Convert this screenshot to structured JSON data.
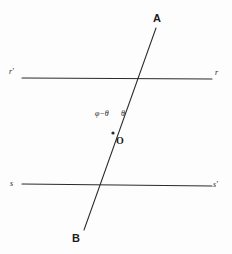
{
  "figure": {
    "background_color": "#fdfdfd",
    "stroke_color": "#2b2b2b",
    "width": 232,
    "height": 254,
    "vertex": {
      "label": "O",
      "x": 113,
      "y": 133,
      "label_x": 116,
      "label_y": 136
    },
    "lines": [
      {
        "name": "line-r",
        "from_label": "r'",
        "to_label": "r",
        "x1": 22,
        "y1": 78,
        "x2": 212,
        "y2": 79
      },
      {
        "name": "line-s",
        "from_label": "s",
        "to_label": "s'",
        "x1": 22,
        "y1": 184,
        "x2": 212,
        "y2": 186
      },
      {
        "name": "line-ab",
        "from_label": "A",
        "to_label": "B",
        "x1": 156,
        "y1": 28,
        "x2": 84,
        "y2": 230
      }
    ],
    "labels": [
      {
        "name": "label-r-prime",
        "text": "r'",
        "x": 9,
        "y": 68,
        "kind": "ray"
      },
      {
        "name": "label-r",
        "text": "r",
        "x": 215,
        "y": 69,
        "kind": "ray"
      },
      {
        "name": "label-s",
        "text": "s",
        "x": 10,
        "y": 180,
        "kind": "ray"
      },
      {
        "name": "label-s-prime",
        "text": "s'",
        "x": 213,
        "y": 181,
        "kind": "ray"
      },
      {
        "name": "label-a",
        "text": "A",
        "x": 153,
        "y": 13,
        "kind": "endpoint"
      },
      {
        "name": "label-b",
        "text": "B",
        "x": 72,
        "y": 233,
        "kind": "endpoint"
      },
      {
        "name": "label-angle-phi-minus-theta",
        "text": "φ−θ",
        "x": 95,
        "y": 110,
        "kind": "angle"
      },
      {
        "name": "label-angle-theta",
        "text": "θ",
        "x": 121,
        "y": 110,
        "kind": "angle"
      }
    ]
  }
}
